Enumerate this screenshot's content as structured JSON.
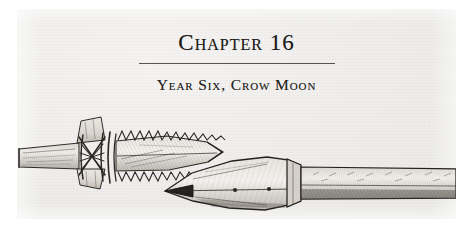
{
  "page": {
    "kind": "book-chapter-opening-page",
    "background_color": "#ffffff",
    "paper_color": "#efeeec",
    "ink_color": "#262422"
  },
  "heading": {
    "chapter_title": "Chapter 16",
    "divider": "horizontal-rule",
    "chapter_subtitle": "Year Six, Crow Moon"
  },
  "illustration": {
    "caption_text": "",
    "style": "pen-and-ink hatched archaeological drawing",
    "objects": [
      {
        "name": "serrated-bone-harpoon-point",
        "description": "barbed antler or bone point with two rows of saw-tooth serrations, lashed with crossed cord binding to a wooden shaft, pointing right",
        "position": "upper-left"
      },
      {
        "name": "leaf-shaped-spearhead",
        "description": "broad leaf-shaped metal spearhead with central midrib and rivets, socketed onto a long hatched shaft, pointing left",
        "position": "lower-right"
      }
    ]
  }
}
